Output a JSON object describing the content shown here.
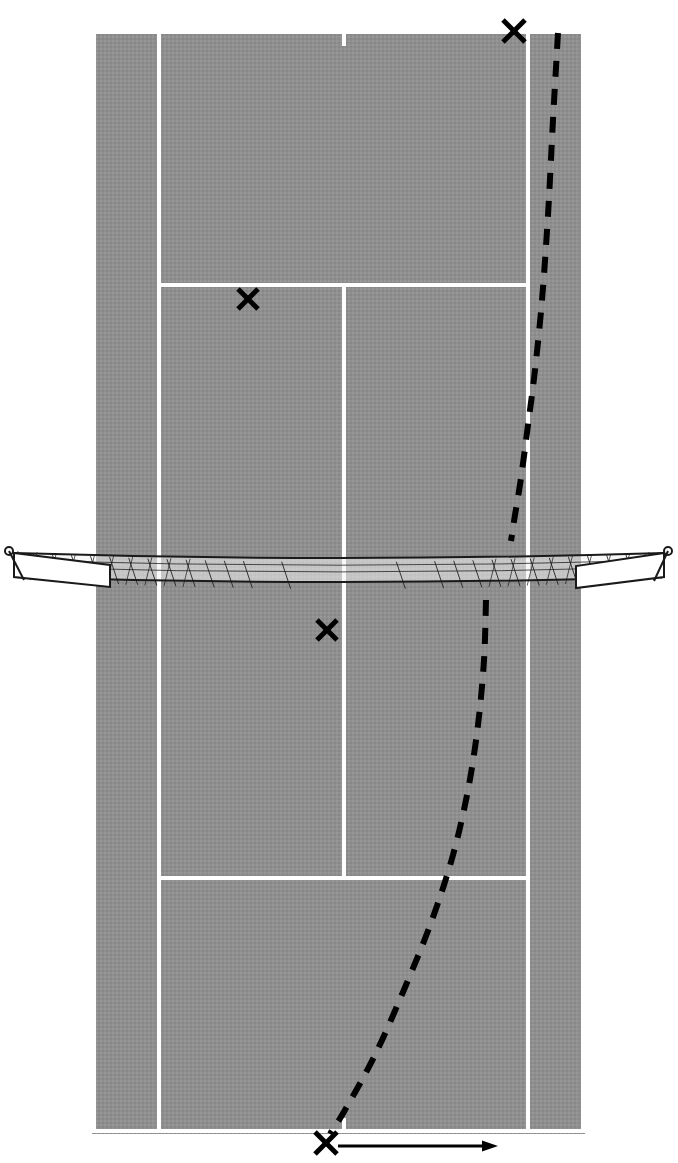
{
  "figure": {
    "kind": "tennis-court-diagram",
    "view": "overhead",
    "width": 678,
    "height": 1163,
    "background_color": "#ffffff"
  },
  "colors": {
    "court_surface": "#8f8f8f",
    "court_line": "#ffffff",
    "trajectory": "#000000",
    "marker": "#000000",
    "net_stroke": "#1a1a1a",
    "net_fill": "#f2f2f2",
    "page_background": "#ffffff"
  },
  "court": {
    "surface": {
      "x": 92,
      "y": 30,
      "width": 493,
      "height": 1104
    },
    "line_width_px": 4,
    "lines": [
      {
        "name": "doubles-sideline-left",
        "x1": 94,
        "y1": 30,
        "x2": 94,
        "y2": 1133
      },
      {
        "name": "doubles-sideline-right",
        "x1": 583,
        "y1": 30,
        "x2": 583,
        "y2": 1133
      },
      {
        "name": "singles-sideline-left",
        "x1": 159,
        "y1": 30,
        "x2": 159,
        "y2": 1133
      },
      {
        "name": "singles-sideline-right",
        "x1": 528,
        "y1": 30,
        "x2": 528,
        "y2": 1133
      },
      {
        "name": "baseline-far",
        "x1": 92,
        "y1": 32,
        "x2": 585,
        "y2": 32
      },
      {
        "name": "baseline-near",
        "x1": 92,
        "y1": 1131,
        "x2": 585,
        "y2": 1131
      },
      {
        "name": "service-line-far",
        "x1": 159,
        "y1": 285,
        "x2": 528,
        "y2": 285
      },
      {
        "name": "service-line-near",
        "x1": 159,
        "y1": 878,
        "x2": 528,
        "y2": 878
      },
      {
        "name": "center-service-line",
        "x1": 344,
        "y1": 285,
        "x2": 344,
        "y2": 878
      },
      {
        "name": "center-mark-far",
        "x1": 344,
        "y1": 30,
        "x2": 344,
        "y2": 46
      },
      {
        "name": "center-mark-near",
        "x1": 344,
        "y1": 1118,
        "x2": 344,
        "y2": 1133
      }
    ]
  },
  "net": {
    "name": "tennis-net",
    "post_left": {
      "cx": 9,
      "cy": 551,
      "r": 4
    },
    "post_right": {
      "cx": 668,
      "cy": 551,
      "r": 4
    },
    "tape_top_left": {
      "x": 14,
      "y": 553
    },
    "tape_top_right": {
      "x": 664,
      "y": 553
    },
    "tape_bottom_left": {
      "x": 14,
      "y": 577
    },
    "tape_bottom_right": {
      "x": 664,
      "y": 577
    },
    "sag_depth_px": 10,
    "mesh_hatch_count": 34
  },
  "markers": [
    {
      "name": "impact-marker-far-baseline",
      "label": "X",
      "x": 514,
      "y": 31,
      "size": 22,
      "description": "ball mark on far baseline near right singles sideline"
    },
    {
      "name": "impact-marker-far-service-box",
      "label": "X",
      "x": 248,
      "y": 299,
      "size": 20,
      "description": "ball mark in far left service box just below service line"
    },
    {
      "name": "impact-marker-near-center-service",
      "label": "X",
      "x": 327,
      "y": 630,
      "size": 20,
      "description": "ball mark beside center service line just past the net"
    },
    {
      "name": "impact-marker-near-baseline",
      "label": "X",
      "x": 326,
      "y": 1143,
      "size": 22,
      "description": "player/ball position at near baseline center mark"
    }
  ],
  "trajectories": [
    {
      "name": "trajectory-upper-dashed",
      "style": "dashed",
      "dash_pattern": "16 12",
      "stroke_width": 6,
      "description": "curved dashed ball path from far baseline X down to the net on the right side",
      "points": [
        {
          "x": 558,
          "y": 33
        },
        {
          "x": 553,
          "y": 120
        },
        {
          "x": 548,
          "y": 215
        },
        {
          "x": 542,
          "y": 300
        },
        {
          "x": 535,
          "y": 370
        },
        {
          "x": 528,
          "y": 425
        },
        {
          "x": 521,
          "y": 478
        },
        {
          "x": 515,
          "y": 515
        },
        {
          "x": 511,
          "y": 541
        }
      ]
    },
    {
      "name": "trajectory-lower-dashed",
      "style": "dashed",
      "dash_pattern": "16 12",
      "stroke_width": 6,
      "description": "curved dashed ball path from the net on the right side down to the near baseline X",
      "points": [
        {
          "x": 486,
          "y": 600
        },
        {
          "x": 484,
          "y": 660
        },
        {
          "x": 478,
          "y": 725
        },
        {
          "x": 468,
          "y": 790
        },
        {
          "x": 453,
          "y": 855
        },
        {
          "x": 432,
          "y": 920
        },
        {
          "x": 406,
          "y": 985
        },
        {
          "x": 375,
          "y": 1055
        },
        {
          "x": 345,
          "y": 1110
        },
        {
          "x": 330,
          "y": 1134
        }
      ]
    }
  ],
  "arrow": {
    "name": "direction-arrow",
    "description": "horizontal arrow pointing right from the near baseline marker",
    "x1": 338,
    "y1": 1146,
    "x2": 498,
    "y2": 1146,
    "stroke_width": 3,
    "head_length": 16,
    "head_width": 11
  }
}
